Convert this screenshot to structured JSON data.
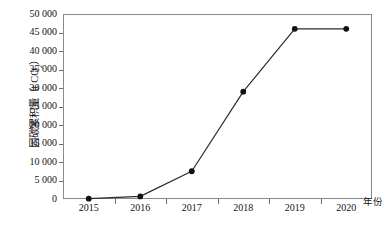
{
  "chart_data": {
    "type": "line",
    "title": "",
    "xlabel": "年份",
    "ylabel": "固碳累积量（t CO2）",
    "ylabel_main": "固碳累积量（t CO",
    "ylabel_sub": "2",
    "ylabel_tail": "）",
    "categories": [
      "2015",
      "2016",
      "2017",
      "2018",
      "2019",
      "2020"
    ],
    "values": [
      100,
      700,
      7500,
      29000,
      46000,
      46000
    ],
    "series": [
      {
        "name": "固碳累积量",
        "values": [
          100,
          700,
          7500,
          29000,
          46000,
          46000
        ]
      }
    ],
    "ylim": [
      0,
      50000
    ],
    "ytick_values": [
      0,
      5000,
      10000,
      15000,
      20000,
      25000,
      30000,
      35000,
      40000,
      45000,
      50000
    ],
    "ytick_labels": [
      "0",
      "5 000",
      "10 000",
      "15 000",
      "20 000",
      "25 000",
      "30 000",
      "35 000",
      "40 000",
      "45 000",
      "50 000"
    ],
    "grid": false,
    "legend": false,
    "legend_position": "none",
    "marker": "filled-circle",
    "line_color": "#2b2b2b",
    "marker_color": "#111111",
    "frame_color": "#8a8a8a",
    "background_color": "#ffffff"
  },
  "axes": {
    "y_title_text": "固碳累积量（t CO2）",
    "x_title_text": "年份"
  }
}
